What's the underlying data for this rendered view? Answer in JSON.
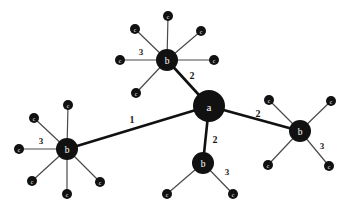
{
  "diagram": {
    "background_color": "#ffffff",
    "node_color": "#111111",
    "edge_color_primary": "#111111",
    "edge_color_secondary": "#4a4a4a",
    "label_text_color": "#ffffff",
    "edge_label_color": "#1a1a1a",
    "width": 352,
    "height": 212
  },
  "chart_data": {
    "type": "graph",
    "node_classes": [
      {
        "class": "a",
        "label": "a",
        "radius": 16,
        "count": 1
      },
      {
        "class": "b",
        "label": "b",
        "radius": 11,
        "count": 4
      },
      {
        "class": "c",
        "label": "c",
        "radius": 5,
        "count": 18
      }
    ],
    "nodes": [
      {
        "id": "a0",
        "label": "a",
        "class": "a",
        "x": 209,
        "y": 106,
        "r": 16
      },
      {
        "id": "bT",
        "label": "b",
        "class": "b",
        "x": 167,
        "y": 60,
        "r": 11
      },
      {
        "id": "bL",
        "label": "b",
        "class": "b",
        "x": 67,
        "y": 149,
        "r": 11
      },
      {
        "id": "bB",
        "label": "b",
        "class": "b",
        "x": 203,
        "y": 163,
        "r": 11
      },
      {
        "id": "bR",
        "label": "b",
        "class": "b",
        "x": 300,
        "y": 131,
        "r": 11
      },
      {
        "id": "cT1",
        "label": "c",
        "class": "c",
        "x": 168,
        "y": 16,
        "r": 5
      },
      {
        "id": "cT2",
        "label": "c",
        "class": "c",
        "x": 135,
        "y": 29,
        "r": 5
      },
      {
        "id": "cT3",
        "label": "c",
        "class": "c",
        "x": 120,
        "y": 60,
        "r": 5
      },
      {
        "id": "cT4",
        "label": "c",
        "class": "c",
        "x": 136,
        "y": 93,
        "r": 5
      },
      {
        "id": "cT5",
        "label": "c",
        "class": "c",
        "x": 201,
        "y": 31,
        "r": 5
      },
      {
        "id": "cT6",
        "label": "c",
        "class": "c",
        "x": 214,
        "y": 60,
        "r": 5
      },
      {
        "id": "cL1",
        "label": "c",
        "class": "c",
        "x": 68,
        "y": 105,
        "r": 5
      },
      {
        "id": "cL2",
        "label": "c",
        "class": "c",
        "x": 34,
        "y": 118,
        "r": 5
      },
      {
        "id": "cL3",
        "label": "c",
        "class": "c",
        "x": 19,
        "y": 149,
        "r": 5
      },
      {
        "id": "cL4",
        "label": "c",
        "class": "c",
        "x": 32,
        "y": 181,
        "r": 5
      },
      {
        "id": "cL5",
        "label": "c",
        "class": "c",
        "x": 67,
        "y": 194,
        "r": 5
      },
      {
        "id": "cL6",
        "label": "c",
        "class": "c",
        "x": 100,
        "y": 182,
        "r": 5
      },
      {
        "id": "cB1",
        "label": "c",
        "class": "c",
        "x": 167,
        "y": 194,
        "r": 5
      },
      {
        "id": "cB2",
        "label": "c",
        "class": "c",
        "x": 233,
        "y": 194,
        "r": 5
      },
      {
        "id": "cR1",
        "label": "c",
        "class": "c",
        "x": 269,
        "y": 100,
        "r": 5
      },
      {
        "id": "cR2",
        "label": "c",
        "class": "c",
        "x": 331,
        "y": 101,
        "r": 5
      },
      {
        "id": "cR3",
        "label": "c",
        "class": "c",
        "x": 268,
        "y": 165,
        "r": 5
      },
      {
        "id": "cR4",
        "label": "c",
        "class": "c",
        "x": 329,
        "y": 166,
        "r": 5
      }
    ],
    "edges": [
      {
        "id": "e-a-bT",
        "source": "a0",
        "target": "bT",
        "label": "2",
        "weight": 2,
        "style": "thick",
        "label_x": 192,
        "label_y": 75
      },
      {
        "id": "e-a-bL",
        "source": "a0",
        "target": "bL",
        "label": "1",
        "weight": 1,
        "style": "thick",
        "label_x": 132,
        "label_y": 119
      },
      {
        "id": "e-a-bB",
        "source": "a0",
        "target": "bB",
        "label": "2",
        "weight": 2,
        "style": "thick",
        "label_x": 215,
        "label_y": 139
      },
      {
        "id": "e-a-bR",
        "source": "a0",
        "target": "bR",
        "label": "2",
        "weight": 2,
        "style": "thick",
        "label_x": 258,
        "label_y": 113
      },
      {
        "id": "e-bT-cT1",
        "source": "bT",
        "target": "cT1",
        "label": "",
        "weight": 3,
        "style": "thin"
      },
      {
        "id": "e-bT-cT2",
        "source": "bT",
        "target": "cT2",
        "label": "",
        "weight": 3,
        "style": "thin"
      },
      {
        "id": "e-bT-cT3",
        "source": "bT",
        "target": "cT3",
        "label": "3",
        "weight": 3,
        "style": "thin",
        "label_x": 141,
        "label_y": 52
      },
      {
        "id": "e-bT-cT4",
        "source": "bT",
        "target": "cT4",
        "label": "",
        "weight": 3,
        "style": "thin"
      },
      {
        "id": "e-bT-cT5",
        "source": "bT",
        "target": "cT5",
        "label": "",
        "weight": 3,
        "style": "thin"
      },
      {
        "id": "e-bT-cT6",
        "source": "bT",
        "target": "cT6",
        "label": "",
        "weight": 3,
        "style": "thin"
      },
      {
        "id": "e-bL-cL1",
        "source": "bL",
        "target": "cL1",
        "label": "",
        "weight": 3,
        "style": "thin"
      },
      {
        "id": "e-bL-cL2",
        "source": "bL",
        "target": "cL2",
        "label": "",
        "weight": 3,
        "style": "thin"
      },
      {
        "id": "e-bL-cL3",
        "source": "bL",
        "target": "cL3",
        "label": "3",
        "weight": 3,
        "style": "thin",
        "label_x": 41,
        "label_y": 141
      },
      {
        "id": "e-bL-cL4",
        "source": "bL",
        "target": "cL4",
        "label": "",
        "weight": 3,
        "style": "thin"
      },
      {
        "id": "e-bL-cL5",
        "source": "bL",
        "target": "cL5",
        "label": "",
        "weight": 3,
        "style": "thin"
      },
      {
        "id": "e-bL-cL6",
        "source": "bL",
        "target": "cL6",
        "label": "",
        "weight": 3,
        "style": "thin"
      },
      {
        "id": "e-bB-cB1",
        "source": "bB",
        "target": "cB1",
        "label": "",
        "weight": 3,
        "style": "thin"
      },
      {
        "id": "e-bB-cB2",
        "source": "bB",
        "target": "cB2",
        "label": "3",
        "weight": 3,
        "style": "thin",
        "label_x": 227,
        "label_y": 172
      },
      {
        "id": "e-bR-cR1",
        "source": "bR",
        "target": "cR1",
        "label": "",
        "weight": 3,
        "style": "thin"
      },
      {
        "id": "e-bR-cR2",
        "source": "bR",
        "target": "cR2",
        "label": "",
        "weight": 3,
        "style": "thin"
      },
      {
        "id": "e-bR-cR3",
        "source": "bR",
        "target": "cR3",
        "label": "",
        "weight": 3,
        "style": "thin"
      },
      {
        "id": "e-bR-cR4",
        "source": "bR",
        "target": "cR4",
        "label": "3",
        "weight": 3,
        "style": "thin",
        "label_x": 322,
        "label_y": 146
      }
    ],
    "edge_labels_visible": [
      "2",
      "1",
      "2",
      "2",
      "3",
      "3",
      "3",
      "3"
    ],
    "node_labels_visible": [
      "a",
      "b",
      "b",
      "b",
      "b",
      "c"
    ]
  }
}
